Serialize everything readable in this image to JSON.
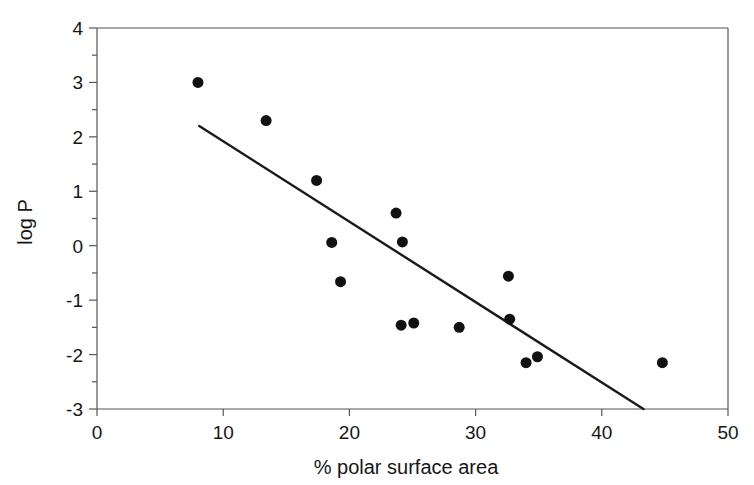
{
  "chart_data": {
    "type": "scatter",
    "title": "",
    "xlabel": "% polar surface area",
    "ylabel": "log P",
    "xlim": [
      0,
      50
    ],
    "ylim": [
      -3,
      4
    ],
    "xticks": [
      0,
      10,
      20,
      30,
      40,
      50
    ],
    "yticks": [
      4,
      3,
      2,
      1,
      0,
      -1,
      -2,
      -3
    ],
    "xtick_labels": [
      "0",
      "10",
      "20",
      "30",
      "40",
      "50"
    ],
    "ytick_labels": [
      "4",
      "3",
      "2",
      "1",
      "0",
      "-1",
      "-2",
      "-3"
    ],
    "grid": false,
    "legend": null,
    "marker": {
      "shape": "circle",
      "color": "#111111",
      "size": 11
    },
    "series": [
      {
        "name": "compounds",
        "points": [
          {
            "x": 8.0,
            "y": 3.0
          },
          {
            "x": 13.4,
            "y": 2.3
          },
          {
            "x": 17.4,
            "y": 1.2
          },
          {
            "x": 18.6,
            "y": 0.06
          },
          {
            "x": 19.3,
            "y": -0.66
          },
          {
            "x": 23.7,
            "y": 0.6
          },
          {
            "x": 24.2,
            "y": 0.07
          },
          {
            "x": 24.1,
            "y": -1.46
          },
          {
            "x": 25.1,
            "y": -1.42
          },
          {
            "x": 28.7,
            "y": -1.5
          },
          {
            "x": 32.6,
            "y": -0.56
          },
          {
            "x": 32.7,
            "y": -1.35
          },
          {
            "x": 34.0,
            "y": -2.15
          },
          {
            "x": 34.9,
            "y": -2.04
          },
          {
            "x": 44.8,
            "y": -2.15
          }
        ]
      }
    ],
    "trendline": {
      "name": "regression-line",
      "color": "#1a1a1a",
      "width": 2.4,
      "x0": 8.1,
      "y0": 2.2,
      "x1": 43.3,
      "y1": -3.0
    },
    "frame": {
      "color": "#555555",
      "width": 1.2
    }
  }
}
